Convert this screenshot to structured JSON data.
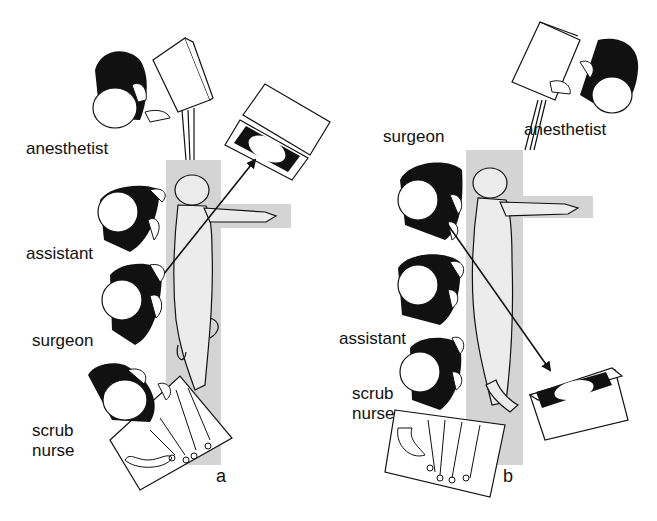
{
  "figure": {
    "panels": [
      {
        "id": "a",
        "letter": "a",
        "labels": {
          "anesthetist": "anesthetist",
          "assistant": "assistant",
          "surgeon": "surgeon",
          "scrub_nurse": "scrub\nnurse"
        }
      },
      {
        "id": "b",
        "letter": "b",
        "labels": {
          "surgeon": "surgeon",
          "anesthetist": "anesthetist",
          "assistant": "assistant",
          "scrub_nurse": "scrub\nnurse"
        }
      }
    ],
    "colors": {
      "table": "#d4d4d4",
      "patient": "#ececec",
      "ink": "#111111",
      "background": "#ffffff"
    }
  }
}
